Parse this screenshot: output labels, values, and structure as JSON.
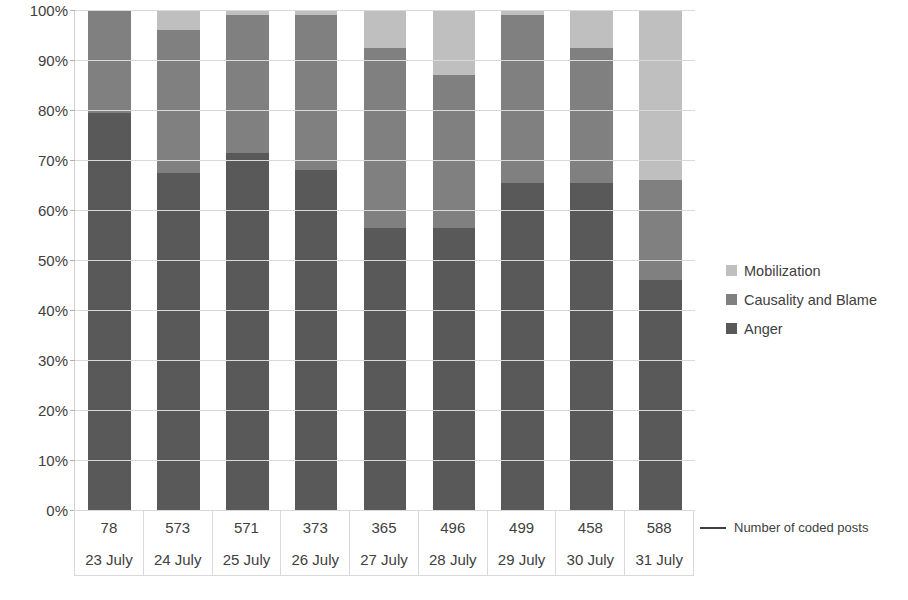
{
  "chart_data": {
    "type": "bar",
    "stacked": true,
    "normalized_percent": true,
    "title": "",
    "xlabel": "",
    "ylabel": "",
    "ylim": [
      0,
      100
    ],
    "grid": true,
    "legend_position": "right",
    "categories": [
      "23 July",
      "24 July",
      "25 July",
      "26 July",
      "27 July",
      "28 July",
      "29 July",
      "30 July",
      "31 July"
    ],
    "secondary_axis_label": "Number of coded posts",
    "coded_posts": [
      78,
      573,
      571,
      373,
      365,
      496,
      499,
      458,
      588
    ],
    "y_tick_labels": [
      "0%",
      "10%",
      "20%",
      "30%",
      "40%",
      "50%",
      "60%",
      "70%",
      "80%",
      "90%",
      "100%"
    ],
    "y_ticks": [
      0,
      10,
      20,
      30,
      40,
      50,
      60,
      70,
      80,
      90,
      100
    ],
    "series": [
      {
        "name": "Anger",
        "color": "#595959",
        "values": [
          79.5,
          67.5,
          71.5,
          68.0,
          56.5,
          56.5,
          65.5,
          65.5,
          46.0
        ]
      },
      {
        "name": "Causality and Blame",
        "color": "#808080",
        "values": [
          20.5,
          28.5,
          27.5,
          31.0,
          36.0,
          30.5,
          33.5,
          27.0,
          20.0
        ]
      },
      {
        "name": "Mobilization",
        "color": "#bfbfbf",
        "values": [
          0.0,
          4.0,
          1.0,
          1.0,
          7.5,
          13.0,
          1.0,
          7.5,
          34.0
        ]
      }
    ]
  },
  "legend": {
    "items": [
      {
        "label": "Mobilization",
        "color": "#bfbfbf"
      },
      {
        "label": "Causality and Blame",
        "color": "#808080"
      },
      {
        "label": "Anger",
        "color": "#595959"
      }
    ]
  },
  "annotation": {
    "text": "Number of coded posts"
  }
}
